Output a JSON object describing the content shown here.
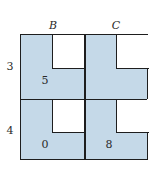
{
  "diagram": {
    "columns": [
      {
        "label": "B"
      },
      {
        "label": "C"
      }
    ],
    "rows": [
      {
        "label": "3"
      },
      {
        "label": "4"
      }
    ],
    "cells": [
      {
        "row": "3",
        "col": "B",
        "value": "5"
      },
      {
        "row": "3",
        "col": "C",
        "value": ""
      },
      {
        "row": "4",
        "col": "B",
        "value": "0"
      },
      {
        "row": "4",
        "col": "C",
        "value": "8"
      }
    ],
    "colors": {
      "fill": "#c5d9e8",
      "border": "#1e1e1e",
      "hole": "#ffffff"
    }
  }
}
